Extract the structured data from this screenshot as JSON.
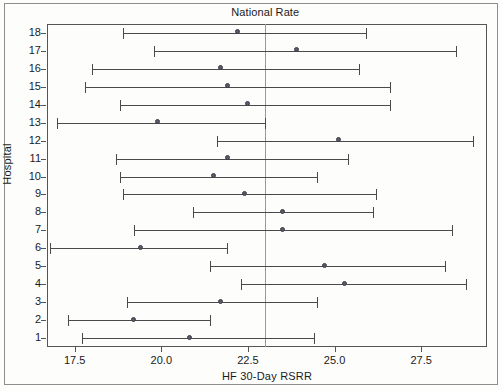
{
  "chart_data": {
    "type": "scatter",
    "title": "National Rate",
    "xlabel": "HF 30-Day RSRR",
    "ylabel": "Hospital",
    "xlim": [
      16.7,
      29.4
    ],
    "ylim": [
      0.5,
      18.5
    ],
    "grid": false,
    "legend": null,
    "annotations": [
      {
        "label": "National Rate",
        "type": "vline",
        "value": 23.0
      }
    ],
    "xticks": [
      17.5,
      20.0,
      22.5,
      25.0,
      27.5
    ],
    "xtick_labels": [
      "17.5",
      "20.0",
      "22.5",
      "25.0",
      "27.5"
    ],
    "yticks": [
      1,
      2,
      3,
      4,
      5,
      6,
      7,
      8,
      9,
      10,
      11,
      12,
      13,
      14,
      15,
      16,
      17,
      18
    ],
    "ytick_labels": [
      "1",
      "2",
      "3",
      "4",
      "5",
      "6",
      "7",
      "8",
      "9",
      "10",
      "11",
      "12",
      "13",
      "14",
      "15",
      "16",
      "17",
      "18"
    ],
    "national_rate": 23.0,
    "marker_color": "#5a5a66",
    "line_color": "#4a4a4a",
    "reference_line_color": "#9a9a9a",
    "series": [
      {
        "name": "HF 30-Day RSRR with 95% interval",
        "points": [
          {
            "hospital": 18,
            "estimate": 22.2,
            "low": 18.9,
            "high": 25.9
          },
          {
            "hospital": 17,
            "estimate": 23.9,
            "low": 19.8,
            "high": 28.5
          },
          {
            "hospital": 16,
            "estimate": 21.7,
            "low": 18.0,
            "high": 25.7
          },
          {
            "hospital": 15,
            "estimate": 21.9,
            "low": 17.8,
            "high": 26.6
          },
          {
            "hospital": 14,
            "estimate": 22.5,
            "low": 18.8,
            "high": 26.6
          },
          {
            "hospital": 13,
            "estimate": 19.9,
            "low": 17.0,
            "high": 23.0
          },
          {
            "hospital": 12,
            "estimate": 25.1,
            "low": 21.6,
            "high": 29.0
          },
          {
            "hospital": 11,
            "estimate": 21.9,
            "low": 18.7,
            "high": 25.4
          },
          {
            "hospital": 10,
            "estimate": 21.5,
            "low": 18.8,
            "high": 24.5
          },
          {
            "hospital": 9,
            "estimate": 22.4,
            "low": 18.9,
            "high": 26.2
          },
          {
            "hospital": 8,
            "estimate": 23.5,
            "low": 20.9,
            "high": 26.1
          },
          {
            "hospital": 7,
            "estimate": 23.5,
            "low": 19.2,
            "high": 28.4
          },
          {
            "hospital": 6,
            "estimate": 19.4,
            "low": 16.8,
            "high": 21.9
          },
          {
            "hospital": 5,
            "estimate": 24.7,
            "low": 21.4,
            "high": 28.2
          },
          {
            "hospital": 4,
            "estimate": 25.3,
            "low": 22.3,
            "high": 28.8
          },
          {
            "hospital": 3,
            "estimate": 21.7,
            "low": 19.0,
            "high": 24.5
          },
          {
            "hospital": 2,
            "estimate": 19.2,
            "low": 17.3,
            "high": 21.4
          },
          {
            "hospital": 1,
            "estimate": 20.8,
            "low": 17.7,
            "high": 24.4
          }
        ]
      }
    ]
  }
}
